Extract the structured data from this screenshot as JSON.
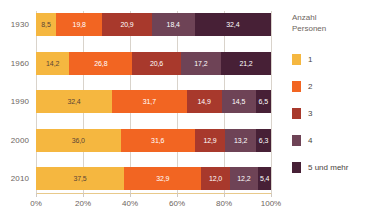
{
  "chart_data": {
    "type": "bar",
    "orientation": "horizontal",
    "stacked": true,
    "stack_mode": "percent",
    "title": "",
    "subtitle": "",
    "xlabel": "",
    "ylabel": "",
    "xlim": [
      0,
      100
    ],
    "grid": true,
    "legend_position": "right",
    "categories": [
      "1930",
      "1960",
      "1990",
      "2000",
      "2010"
    ],
    "xticks": [
      0,
      20,
      40,
      60,
      80,
      100
    ],
    "xticklabels": [
      "0%",
      "20%",
      "40%",
      "60%",
      "80%",
      "100%"
    ],
    "series": [
      {
        "name": "1",
        "color": "#F5B740",
        "text_color": "#5b4636",
        "values": [
          8.5,
          14.2,
          32.4,
          36.0,
          37.5
        ],
        "labels": [
          "8,5",
          "14,2",
          "32,4",
          "36,0",
          "37,5"
        ]
      },
      {
        "name": "2",
        "color": "#F26522",
        "text_color": "#ffffff",
        "values": [
          19.8,
          26.8,
          31.7,
          31.6,
          32.9
        ],
        "labels": [
          "19,8",
          "26,8",
          "31,7",
          "31,6",
          "32,9"
        ]
      },
      {
        "name": "3",
        "color": "#A8392C",
        "text_color": "#ffffff",
        "values": [
          20.9,
          20.6,
          14.9,
          12.9,
          12.0
        ],
        "labels": [
          "20,9",
          "20,6",
          "14,9",
          "12,9",
          "12,0"
        ]
      },
      {
        "name": "4",
        "color": "#6E4356",
        "text_color": "#ffffff",
        "values": [
          18.4,
          17.2,
          14.5,
          13.2,
          12.2
        ],
        "labels": [
          "18,4",
          "17,2",
          "14,5",
          "13,2",
          "12,2"
        ]
      },
      {
        "name": "5 und mehr",
        "color": "#472036",
        "text_color": "#ffffff",
        "values": [
          32.4,
          21.2,
          6.5,
          6.3,
          5.4
        ],
        "labels": [
          "32,4",
          "21,2",
          "6,5",
          "6,3",
          "5,4"
        ]
      }
    ]
  },
  "legend": {
    "title": "Anzahl\nPersonen",
    "items": [
      {
        "label": "1",
        "color": "#F5B740"
      },
      {
        "label": "2",
        "color": "#F26522"
      },
      {
        "label": "3",
        "color": "#A8392C"
      },
      {
        "label": "4",
        "color": "#6E4356"
      },
      {
        "label": "5 und mehr",
        "color": "#472036"
      }
    ]
  },
  "axis": {
    "y_labels": [
      "1930",
      "1960",
      "1990",
      "2000",
      "2010"
    ],
    "x_labels": [
      "0%",
      "20%",
      "40%",
      "60%",
      "80%",
      "100%"
    ]
  }
}
